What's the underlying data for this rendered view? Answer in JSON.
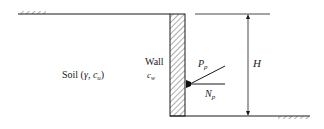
{
  "diagram": {
    "soil_label": {
      "text": "Soil (",
      "gamma": "γ",
      "sep": ", ",
      "c": "c",
      "c_sub": "u",
      "close": ")"
    },
    "wall_label": "Wall",
    "wall_adhesion": {
      "c": "c",
      "sub": "w"
    },
    "passive_force": {
      "P": "P",
      "sub": "p"
    },
    "normal_force": {
      "N": "N",
      "sub": "p"
    },
    "height_label": "H",
    "colors": {
      "line": "#1a1a1a",
      "hatch": "#333333",
      "background": "#ffffff"
    }
  }
}
